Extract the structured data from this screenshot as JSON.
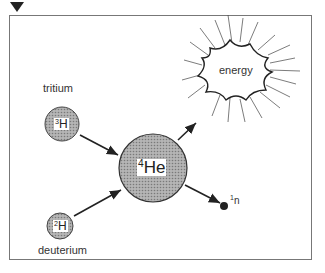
{
  "diagram": {
    "nodes": {
      "tritium": {
        "label": "tritium",
        "mass": "3",
        "symbol": "H"
      },
      "deuterium": {
        "label": "deuterium",
        "mass": "2",
        "symbol": "H"
      },
      "helium": {
        "mass": "4",
        "symbol": "He"
      },
      "energy": {
        "label": "energy"
      },
      "neutron": {
        "mass": "1",
        "symbol": "n"
      }
    },
    "edges": [
      {
        "from": "tritium",
        "to": "helium"
      },
      {
        "from": "deuterium",
        "to": "helium"
      },
      {
        "from": "helium",
        "to": "energy"
      },
      {
        "from": "helium",
        "to": "neutron"
      }
    ],
    "colors": {
      "nucleus_fill": "#9a9a9a",
      "line": "#222222",
      "frame": "#777777"
    }
  }
}
